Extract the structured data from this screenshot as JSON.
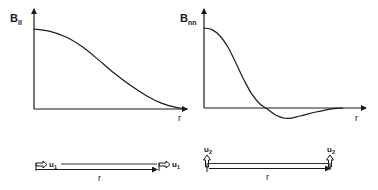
{
  "figure": {
    "panels": [
      {
        "id": "longitudinal",
        "y_label_main": "B",
        "y_label_sub": "ll",
        "x_label": "r",
        "curve_description": "monotonic decay from maximum at r=0 to zero",
        "curve_points": [
          [
            0,
            1.0
          ],
          [
            0.1,
            0.97
          ],
          [
            0.2,
            0.9
          ],
          [
            0.3,
            0.78
          ],
          [
            0.4,
            0.62
          ],
          [
            0.5,
            0.45
          ],
          [
            0.6,
            0.3
          ],
          [
            0.7,
            0.17
          ],
          [
            0.8,
            0.07
          ],
          [
            0.9,
            0.015
          ],
          [
            0.96,
            0.0
          ]
        ]
      },
      {
        "id": "transverse",
        "y_label_main": "B",
        "y_label_sub": "nn",
        "x_label": "r",
        "curve_description": "decay from maximum at r=0, crosses zero, negative lobe, returns to zero",
        "curve_points": [
          [
            0,
            1.0
          ],
          [
            0.05,
            0.98
          ],
          [
            0.1,
            0.9
          ],
          [
            0.15,
            0.76
          ],
          [
            0.2,
            0.56
          ],
          [
            0.25,
            0.35
          ],
          [
            0.3,
            0.17
          ],
          [
            0.35,
            0.05
          ],
          [
            0.4,
            -0.02
          ],
          [
            0.45,
            -0.09
          ],
          [
            0.52,
            -0.13
          ],
          [
            0.6,
            -0.1
          ],
          [
            0.7,
            -0.05
          ],
          [
            0.8,
            -0.01
          ],
          [
            0.87,
            0.0
          ]
        ]
      }
    ],
    "velocity_diagrams": [
      {
        "id": "longitudinal-velocities",
        "velocity_label_main": "u",
        "velocity_label_sub": "1",
        "separation_label": "r",
        "arrow_orientation": "parallel"
      },
      {
        "id": "transverse-velocities",
        "velocity_label_main": "u",
        "velocity_label_sub": "2",
        "separation_label": "r",
        "arrow_orientation": "perpendicular"
      }
    ],
    "colors": {
      "ink": "#1a1a1a",
      "background": "#ffffff"
    }
  }
}
